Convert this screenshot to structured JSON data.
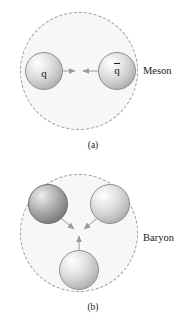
{
  "figure": {
    "background_color": "#ffffff",
    "confinement_fill": "#f7f7f7",
    "confinement_stroke": "#9a9a9a",
    "arrow_color": "#9a9a9a"
  },
  "panels": [
    {
      "id": "meson",
      "particle_label": "Meson",
      "caption": "(a)",
      "constituents": [
        {
          "label": "q",
          "overbar": false,
          "shade": "light"
        },
        {
          "label": "q",
          "overbar": true,
          "shade": "light"
        }
      ]
    },
    {
      "id": "baryon",
      "particle_label": "Baryon",
      "caption": "(b)",
      "constituents": [
        {
          "label": "",
          "overbar": false,
          "shade": "dark"
        },
        {
          "label": "",
          "overbar": false,
          "shade": "light"
        },
        {
          "label": "",
          "overbar": false,
          "shade": "light"
        }
      ]
    }
  ]
}
